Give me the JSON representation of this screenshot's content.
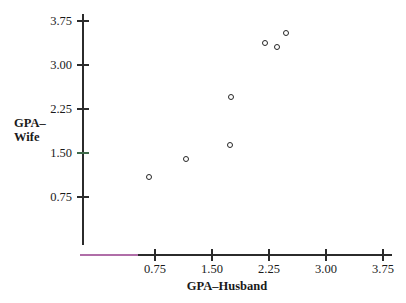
{
  "chart_data": {
    "type": "scatter",
    "title": "",
    "xlabel": "GPA–Husband",
    "ylabel_lines": [
      "GPA–",
      "Wife"
    ],
    "ylabel": "GPA–Wife",
    "xlim": [
      0,
      4.0
    ],
    "ylim": [
      0,
      4.0
    ],
    "xticks": [
      "0.75",
      "1.50",
      "2.25",
      "3.00",
      "3.75"
    ],
    "xtick_values": [
      0.75,
      1.5,
      2.25,
      3.0,
      3.75
    ],
    "yticks": [
      "3.75",
      "3.00",
      "2.25",
      "1.50",
      "0.75"
    ],
    "ytick_values": [
      3.75,
      3.0,
      2.25,
      1.5,
      0.75
    ],
    "grid": false,
    "legend": null,
    "marker_style": "open-circle",
    "marker_color": "#262626",
    "axis_color": "#2b2b2b",
    "accent_color": "#b06ea8",
    "points": [
      {
        "x": 0.67,
        "y": 1.09
      },
      {
        "x": 1.16,
        "y": 1.4
      },
      {
        "x": 1.74,
        "y": 1.63
      },
      {
        "x": 1.75,
        "y": 2.45
      },
      {
        "x": 2.2,
        "y": 3.37
      },
      {
        "x": 2.36,
        "y": 3.3
      },
      {
        "x": 2.47,
        "y": 3.54
      }
    ]
  }
}
